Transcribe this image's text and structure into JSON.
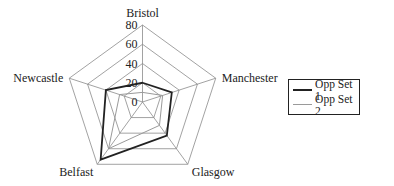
{
  "chart_data": {
    "type": "radar",
    "title": "",
    "categories": [
      "Bristol",
      "Manchester",
      "Glasgow",
      "Belfast",
      "Newcastle"
    ],
    "series": [
      {
        "name": "Opp Set 1",
        "values": [
          20,
          32,
          43,
          74,
          40
        ],
        "color": "#222222",
        "width": 1.8
      },
      {
        "name": "Opp Set 2",
        "values": [
          10,
          22,
          30,
          60,
          25
        ],
        "color": "#9a9a9a",
        "width": 1
      }
    ],
    "axis": {
      "min": 0,
      "max": 80,
      "step": 20,
      "ticks": [
        "0",
        "20",
        "40",
        "60",
        "80"
      ]
    },
    "grid": true,
    "legend_position": "right"
  },
  "legend": {
    "items": [
      {
        "label": "Opp Set 1",
        "color": "#222222"
      },
      {
        "label": "Opp Set 2",
        "color": "#9a9a9a"
      }
    ]
  }
}
